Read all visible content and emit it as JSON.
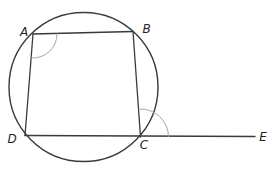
{
  "figure": {
    "width": 277,
    "height": 173,
    "colors": {
      "background": "#ffffff",
      "stroke": "#3a3a3a",
      "angle_arc": "#a6a6a6",
      "label": "#1f1f1f"
    },
    "stroke_widths": {
      "circle": 1.4,
      "sides": 1.3,
      "secant": 1.3,
      "angle_arc": 1.0
    },
    "circle": {
      "cx": 83.5,
      "cy": 87,
      "r": 74.5
    },
    "points": {
      "A": {
        "x": 33,
        "y": 34
      },
      "B": {
        "x": 133,
        "y": 31.5
      },
      "C": {
        "x": 140.5,
        "y": 137
      },
      "D": {
        "x": 25,
        "y": 135.5
      },
      "E": {
        "x": 255,
        "y": 136.5
      }
    },
    "sides": [
      {
        "from": "A",
        "to": "B"
      },
      {
        "from": "B",
        "to": "C"
      },
      {
        "from": "D",
        "to": "A"
      }
    ],
    "secant_line": {
      "from": "D",
      "through": "C",
      "to": "E"
    },
    "angle_marks": [
      {
        "vertex": "A",
        "from_ray": "B",
        "to_ray": "D",
        "radius": 24
      },
      {
        "vertex": "C",
        "from_ray": "E",
        "to_ray": "B",
        "radius": 28
      }
    ],
    "labels": [
      {
        "text": "A",
        "x": 24,
        "y": 35.5
      },
      {
        "text": "B",
        "x": 146.5,
        "y": 33
      },
      {
        "text": "C",
        "x": 144,
        "y": 149
      },
      {
        "text": "D",
        "x": 12,
        "y": 142.5
      },
      {
        "text": "E",
        "x": 263,
        "y": 141
      }
    ],
    "label_font_size": 12
  }
}
